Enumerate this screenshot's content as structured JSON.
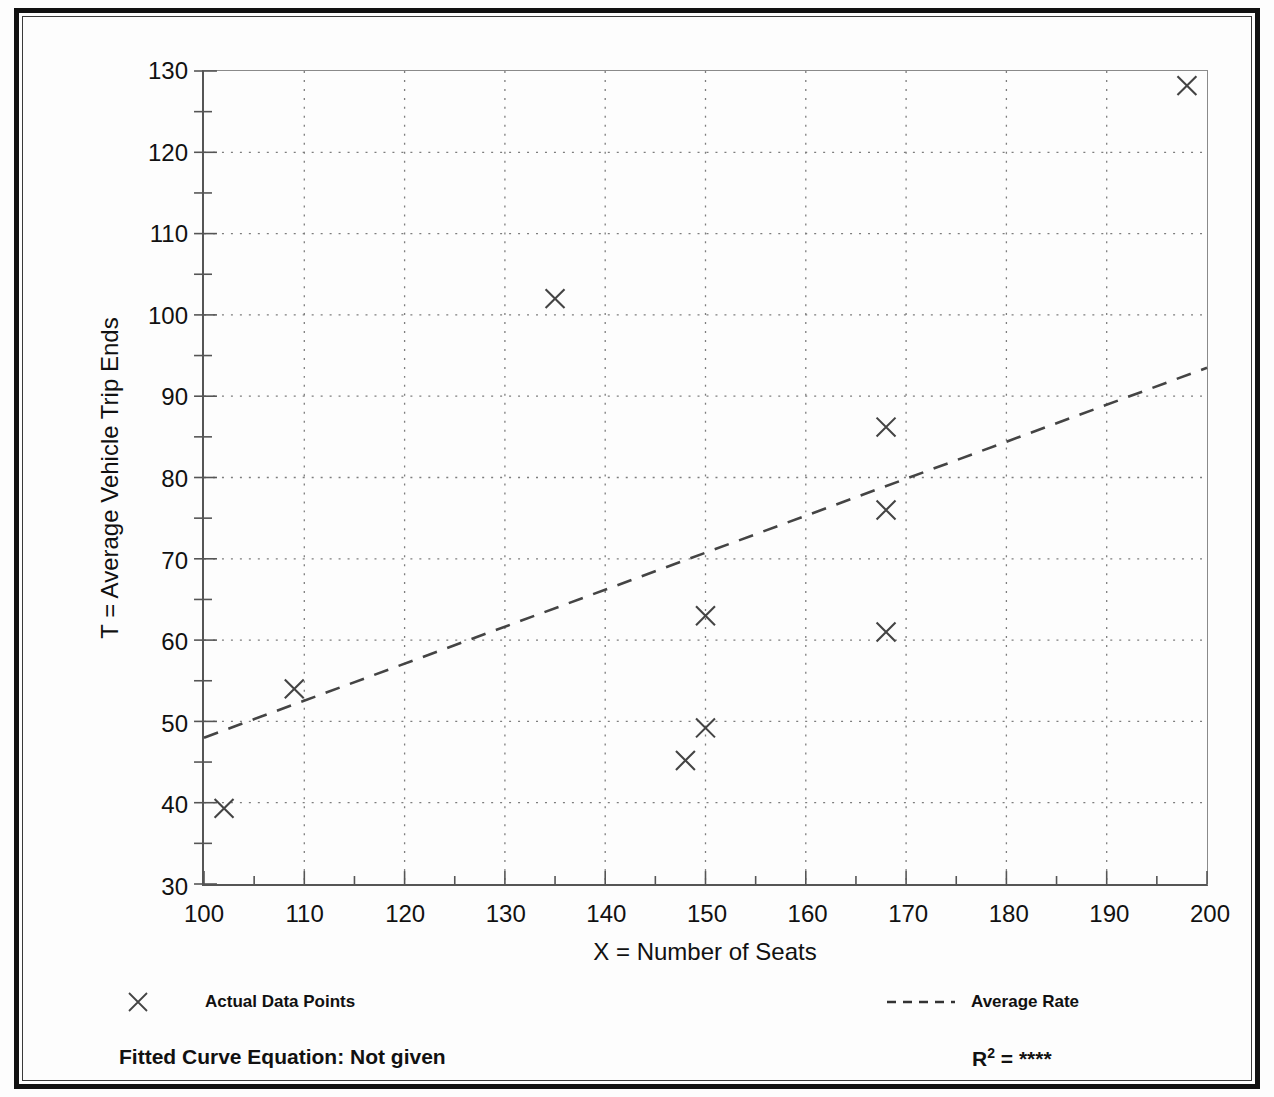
{
  "figure": {
    "title_stub": "",
    "background": "#fdfdfd",
    "frame_color": "#111111"
  },
  "legend": {
    "points_label": "Actual Data Points",
    "line_label": "Average Rate",
    "point_marker_icon": "x-marker-icon",
    "line_marker_icon": "dashed-line-icon"
  },
  "footer": {
    "fitted_curve_label": "Fitted Curve Equation:  Not given",
    "r_squared_prefix": "R",
    "r_squared_exponent": "2",
    "r_squared_equals": " = ",
    "r_squared_value": "****"
  },
  "chart_data": {
    "type": "scatter",
    "title": "",
    "xlabel": "X = Number of Seats",
    "ylabel": "T = Average Vehicle Trip Ends",
    "xlim": [
      100,
      200
    ],
    "ylim": [
      30,
      130
    ],
    "xticks": [
      100,
      110,
      120,
      130,
      140,
      150,
      160,
      170,
      180,
      190,
      200
    ],
    "yticks": [
      30,
      40,
      50,
      60,
      70,
      80,
      90,
      100,
      110,
      120,
      130
    ],
    "xminor_step": 5,
    "yminor_step": 5,
    "grid": true,
    "grid_style": "dotted",
    "legend_position": "below-axes",
    "series": [
      {
        "name": "Actual Data Points",
        "type": "scatter",
        "marker": "x",
        "color": "#444444",
        "points": [
          {
            "x": 102,
            "y": 39.3
          },
          {
            "x": 109,
            "y": 54.0
          },
          {
            "x": 135,
            "y": 102.0
          },
          {
            "x": 148,
            "y": 45.2
          },
          {
            "x": 150,
            "y": 49.2
          },
          {
            "x": 150,
            "y": 63.0
          },
          {
            "x": 168,
            "y": 61.0
          },
          {
            "x": 168,
            "y": 76.0
          },
          {
            "x": 168,
            "y": 86.2
          },
          {
            "x": 198,
            "y": 128.2
          }
        ]
      },
      {
        "name": "Average Rate",
        "type": "line",
        "style": "dashed",
        "color": "#444444",
        "endpoints": [
          {
            "x": 100,
            "y": 48.0
          },
          {
            "x": 200,
            "y": 93.5
          }
        ]
      }
    ]
  }
}
